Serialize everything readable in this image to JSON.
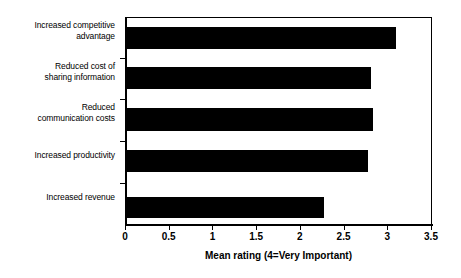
{
  "chart_data": {
    "type": "bar",
    "orientation": "horizontal",
    "title": "",
    "xlabel": "Mean rating (4=Very Important)",
    "ylabel": "",
    "xlim": [
      0,
      3.5
    ],
    "xticks": [
      "0",
      "0.5",
      "1",
      "1.5",
      "2",
      "2.5",
      "3",
      "3.5"
    ],
    "xtick_values": [
      0,
      0.5,
      1,
      1.5,
      2,
      2.5,
      3,
      3.5
    ],
    "grid": false,
    "legend": null,
    "bar_color": "#000000",
    "categories": [
      "Increased competitive advantage",
      "Reduced cost of sharing information",
      "Reduced communication costs",
      "Increased productivity",
      "Increased revenue"
    ],
    "category_lines": [
      [
        "Increased competitive",
        "advantage"
      ],
      [
        "Reduced cost of",
        "sharing information"
      ],
      [
        "Reduced",
        "communication costs"
      ],
      [
        "Increased productivity"
      ],
      [
        "Increased revenue"
      ]
    ],
    "values": [
      3.09,
      2.8,
      2.82,
      2.77,
      2.27
    ]
  }
}
